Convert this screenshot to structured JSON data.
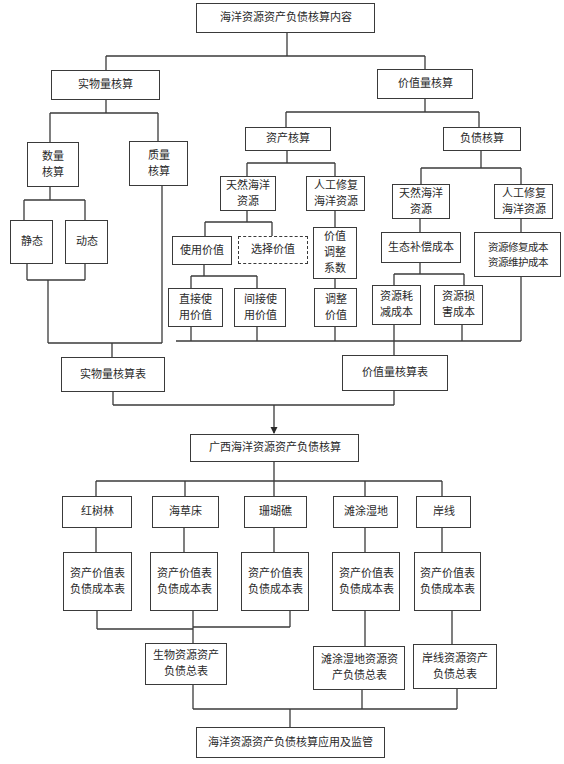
{
  "diagram": {
    "root": "海洋资源资产负债核算内容",
    "physical": {
      "title": "实物量核算",
      "quantity": "数量\n核算",
      "quality": "质量\n核算",
      "static": "静态",
      "dynamic": "动态",
      "table": "实物量核算表"
    },
    "value": {
      "title": "价值量核算",
      "assets": {
        "title": "资产核算",
        "natural": "天然海洋\n资源",
        "artificial": "人工修复\n海洋资源",
        "use_value": "使用价值",
        "option_value": "选择价值",
        "direct_use": "直接使\n用价值",
        "indirect_use": "间接使\n用价值",
        "adjust_coef": "价值\n调整\n系数",
        "adjusted_value": "调整\n价值"
      },
      "liabilities": {
        "title": "负债核算",
        "natural": "天然海洋\n资源",
        "artificial": "人工修复\n海洋资源",
        "eco_comp": "生态补偿成本",
        "restore_maintain": "资源修复成本\n资源维护成本",
        "depletion": "资源耗\n减成本",
        "damage": "资源损\n害成本"
      },
      "table": "价值量核算表"
    },
    "guangxi": {
      "title": "广西海洋资源资产负债核算",
      "categories": [
        {
          "name": "红树林",
          "tables": "资产价值表\n负债成本表"
        },
        {
          "name": "海草床",
          "tables": "资产价值表\n负债成本表"
        },
        {
          "name": "珊瑚礁",
          "tables": "资产价值表\n负债成本表"
        },
        {
          "name": "滩涂湿地",
          "tables": "资产价值表\n负债成本表"
        },
        {
          "name": "岸线",
          "tables": "资产价值表\n负债成本表"
        }
      ],
      "summaries": {
        "bio": "生物资源资产\n负债总表",
        "wetland": "滩涂湿地资源资\n产负债总表",
        "coast": "岸线资源资产\n负债总表"
      }
    },
    "final": "海洋资源资产负债核算应用及监管"
  }
}
